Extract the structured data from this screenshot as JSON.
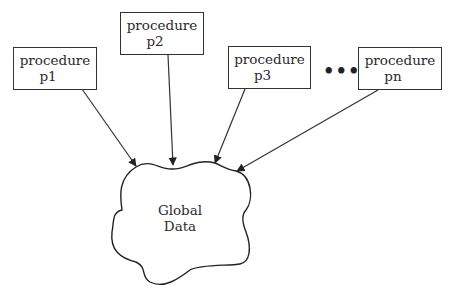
{
  "diagram": {
    "procedures": [
      {
        "line1": "procedure",
        "line2": "p1"
      },
      {
        "line1": "procedure",
        "line2": "p2"
      },
      {
        "line1": "procedure",
        "line2": "p3"
      },
      {
        "line1": "procedure",
        "line2": "pn"
      }
    ],
    "ellipsis": "•••",
    "global_data": {
      "line1": "Global",
      "line2": "Data"
    }
  }
}
